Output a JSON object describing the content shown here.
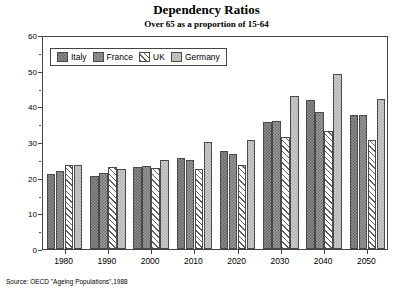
{
  "chart_data": {
    "type": "bar",
    "title": "Dependency Ratios",
    "subtitle": "Over 65 as a proportion of 15-64",
    "xlabel": "",
    "ylabel": "",
    "ylim": [
      0,
      60
    ],
    "yticks": [
      0,
      10,
      20,
      30,
      40,
      50,
      60
    ],
    "grid": false,
    "legend_position": "top-left",
    "categories": [
      "1980",
      "1990",
      "2000",
      "2010",
      "2020",
      "2030",
      "2040",
      "2050"
    ],
    "series": [
      {
        "name": "Italy",
        "values": [
          21.0,
          20.4,
          23.0,
          25.5,
          27.5,
          35.5,
          41.8,
          37.5
        ]
      },
      {
        "name": "France",
        "values": [
          22.0,
          21.2,
          23.3,
          25.0,
          26.5,
          36.0,
          38.5,
          37.5
        ]
      },
      {
        "name": "UK",
        "values": [
          23.5,
          23.0,
          22.7,
          22.3,
          23.5,
          31.3,
          33.0,
          30.5
        ]
      },
      {
        "name": "Germany",
        "values": [
          23.5,
          22.5,
          25.0,
          30.0,
          30.5,
          43.0,
          49.0,
          42.0
        ]
      }
    ],
    "source": "Source: OECD \"Ageing Populations\",1988"
  },
  "legend": {
    "items": [
      {
        "label": "Italy"
      },
      {
        "label": "France"
      },
      {
        "label": "UK"
      },
      {
        "label": "Germany"
      }
    ]
  }
}
